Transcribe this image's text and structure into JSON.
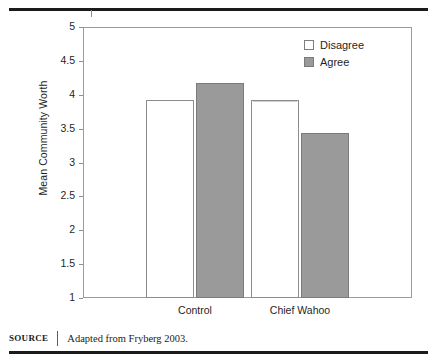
{
  "figure": {
    "source_label": "SOURCE",
    "source_text": "Adapted from Fryberg 2003."
  },
  "chart_data": {
    "type": "bar",
    "title": "",
    "xlabel": "",
    "ylabel": "Mean Community Worth",
    "categories": [
      "Control",
      "Chief Wahoo"
    ],
    "series": [
      {
        "name": "Disagree",
        "color": "#ffffff",
        "values": [
          3.93,
          3.93
        ]
      },
      {
        "name": "Agree",
        "color": "#9a9a9a",
        "values": [
          4.17,
          3.44
        ]
      }
    ],
    "ylim": [
      1,
      5
    ],
    "yticks": [
      "5",
      "4.5",
      "4",
      "3.5",
      "3",
      "2.5",
      "2",
      "1.5",
      "1"
    ],
    "ytick_values": [
      5,
      4.5,
      4,
      3.5,
      3,
      2.5,
      2,
      1.5,
      1
    ],
    "grid": false,
    "legend_position": "top-right"
  }
}
